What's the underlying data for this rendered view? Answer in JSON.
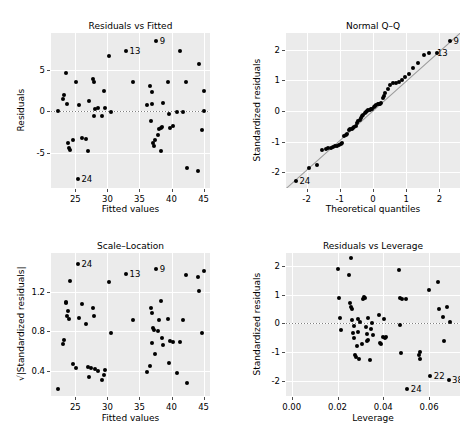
{
  "figure": {
    "background": "#ffffff",
    "panel_background": "#ebebeb",
    "grid_color": "#ffffff",
    "point_color": "#000000",
    "reference_line_color": "#808080"
  },
  "chart_data": [
    {
      "type": "scatter",
      "name": "residuals-vs-fitted",
      "title": "Residuals vs Fitted",
      "xlabel": "Fitted values",
      "ylabel": "Residuals",
      "xlim": [
        21.2,
        46.0
      ],
      "ylim": [
        -9.2,
        9.4
      ],
      "xticks": [
        25,
        30,
        35,
        40,
        45
      ],
      "yticks": [
        -5,
        0,
        5
      ],
      "grid": true,
      "hline": 0,
      "x": [
        22.3,
        23.0,
        23.3,
        23.6,
        23.7,
        23.9,
        24.0,
        24.2,
        24.6,
        25.1,
        25.4,
        25.5,
        26.0,
        26.6,
        27.0,
        27.2,
        27.8,
        27.9,
        27.9,
        28.0,
        28.6,
        29.2,
        29.5,
        29.6,
        30.3,
        30.6,
        32.9,
        34.0,
        36.2,
        36.6,
        36.8,
        36.9,
        37.0,
        37.1,
        37.2,
        37.4,
        37.6,
        37.9,
        38.1,
        38.3,
        38.4,
        38.5,
        38.6,
        39.4,
        39.6,
        39.8,
        40.2,
        40.8,
        41.3,
        41.8,
        42.3,
        42.4,
        44.1,
        44.3,
        44.8,
        45.0,
        45.1
      ],
      "y": [
        0.1,
        1.5,
        2.0,
        4.6,
        0.9,
        -3.8,
        -4.4,
        -4.6,
        -3.4,
        3.5,
        -8.1,
        0.8,
        -3.2,
        -3.3,
        -4.8,
        1.2,
        3.9,
        3.5,
        -0.6,
        0.3,
        0.4,
        -0.6,
        2.4,
        0.4,
        6.7,
        -0.1,
        7.2,
        3.5,
        0.8,
        3.0,
        -1.1,
        0.9,
        2.3,
        -3.8,
        -4.1,
        -3.4,
        8.4,
        -2.8,
        -2.1,
        -4.7,
        -2.0,
        -1.9,
        1.0,
        3.5,
        -0.3,
        -2.0,
        -1.8,
        -0.1,
        7.3,
        -0.1,
        3.5,
        -6.8,
        -7.1,
        5.7,
        -2.2,
        2.5,
        0.1
      ],
      "labeled_points": [
        {
          "label": "9",
          "x": 37.6,
          "y": 8.4
        },
        {
          "label": "13",
          "x": 32.9,
          "y": 7.2
        },
        {
          "label": "24",
          "x": 25.4,
          "y": -8.1
        }
      ]
    },
    {
      "type": "scatter",
      "name": "normal-qq",
      "title": "Normal Q–Q",
      "xlabel": "Theoretical quantiles",
      "ylabel": "Standardized residuals",
      "xlim": [
        -2.62,
        2.62
      ],
      "ylim": [
        -2.52,
        2.55
      ],
      "xticks": [
        -2,
        -1,
        0,
        1,
        2
      ],
      "yticks": [
        -2,
        -1,
        0,
        1,
        2
      ],
      "grid": true,
      "qq_line": {
        "slope": 0.97,
        "intercept": 0.02
      },
      "x": [
        -2.32,
        -1.93,
        -1.7,
        -1.53,
        -1.43,
        -1.35,
        -1.27,
        -1.2,
        -1.14,
        -1.08,
        -1.02,
        -0.97,
        -0.92,
        -0.87,
        -0.82,
        -0.78,
        -0.73,
        -0.69,
        -0.64,
        -0.6,
        -0.56,
        -0.52,
        -0.48,
        -0.44,
        -0.4,
        -0.36,
        -0.32,
        -0.29,
        -0.25,
        -0.21,
        -0.17,
        -0.14,
        -0.1,
        -0.06,
        -0.02,
        0.02,
        0.06,
        0.1,
        0.14,
        0.17,
        0.21,
        0.25,
        0.29,
        0.32,
        0.36,
        0.44,
        0.52,
        0.6,
        0.69,
        0.78,
        0.87,
        0.97,
        1.08,
        1.2,
        1.35,
        1.53,
        1.7,
        1.93,
        2.32
      ],
      "y": [
        -2.28,
        -1.88,
        -1.78,
        -1.27,
        -1.26,
        -1.22,
        -1.2,
        -1.18,
        -1.16,
        -1.14,
        -1.12,
        -1.08,
        -1.05,
        -0.82,
        -0.8,
        -0.76,
        -0.62,
        -0.6,
        -0.58,
        -0.56,
        -0.54,
        -0.5,
        -0.4,
        -0.34,
        -0.28,
        -0.22,
        -0.18,
        -0.12,
        -0.08,
        -0.04,
        0.0,
        0.02,
        0.04,
        0.06,
        0.08,
        0.12,
        0.16,
        0.2,
        0.22,
        0.24,
        0.24,
        0.26,
        0.44,
        0.5,
        0.58,
        0.72,
        0.86,
        0.9,
        0.92,
        0.96,
        1.02,
        1.1,
        1.2,
        1.42,
        1.56,
        1.82,
        1.88,
        1.9,
        2.28
      ],
      "labeled_points": [
        {
          "label": "9",
          "x": 2.32,
          "y": 2.28
        },
        {
          "label": "13",
          "x": 1.82,
          "y": 1.88
        },
        {
          "label": "24",
          "x": -2.32,
          "y": -2.28
        }
      ]
    },
    {
      "type": "scatter",
      "name": "scale-location",
      "title": "Scale–Location",
      "xlabel": "Fitted values",
      "ylabel": "√|Standardized residuals|",
      "xlim": [
        21.2,
        46.0
      ],
      "ylim": [
        0.14,
        1.6
      ],
      "xticks": [
        25,
        30,
        35,
        40,
        45
      ],
      "yticks": [
        0.4,
        0.8,
        1.2
      ],
      "grid": true,
      "x": [
        22.3,
        23.0,
        23.3,
        23.5,
        23.6,
        23.7,
        23.9,
        24.0,
        24.2,
        24.6,
        25.1,
        25.4,
        25.5,
        26.0,
        26.6,
        27.0,
        27.2,
        27.4,
        27.8,
        27.9,
        28.0,
        28.6,
        29.2,
        29.5,
        29.6,
        30.3,
        30.6,
        32.9,
        34.0,
        36.2,
        36.6,
        36.8,
        36.9,
        37.0,
        37.1,
        37.2,
        37.4,
        37.6,
        37.9,
        38.1,
        38.3,
        38.5,
        38.6,
        39.4,
        39.6,
        39.8,
        40.2,
        40.8,
        41.3,
        41.8,
        42.3,
        42.4,
        44.1,
        44.3,
        44.8,
        45.0
      ],
      "y": [
        0.21,
        0.67,
        0.71,
        1.09,
        1.1,
        0.96,
        1.01,
        0.93,
        1.31,
        0.47,
        0.43,
        1.49,
        0.94,
        1.08,
        0.88,
        0.44,
        0.33,
        0.43,
        1.04,
        0.96,
        0.42,
        0.4,
        0.3,
        0.35,
        0.41,
        1.3,
        0.78,
        1.39,
        0.92,
        0.38,
        0.45,
        1.04,
        0.99,
        0.68,
        0.83,
        0.81,
        0.57,
        1.44,
        0.8,
        0.92,
        1.11,
        0.73,
        0.66,
        0.93,
        0.48,
        0.7,
        0.69,
        0.37,
        0.69,
        0.92,
        1.38,
        0.27,
        1.36,
        1.21,
        0.78,
        1.42
      ],
      "labeled_points": [
        {
          "label": "24",
          "x": 25.4,
          "y": 1.49
        },
        {
          "label": "9",
          "x": 37.6,
          "y": 1.44
        },
        {
          "label": "13",
          "x": 32.9,
          "y": 1.39
        }
      ]
    },
    {
      "type": "scatter",
      "name": "residuals-vs-leverage",
      "title": "Residuals vs Leverage",
      "xlabel": "Leverage",
      "ylabel": "Standardized residuals",
      "xlim": [
        -0.0025,
        0.0735
      ],
      "ylim": [
        -2.52,
        2.45
      ],
      "xticks": [
        0.0,
        0.02,
        0.04,
        0.06
      ],
      "xticklabels": [
        "0.00",
        "0.02",
        "0.04",
        "0.06"
      ],
      "yticks": [
        -2,
        -1,
        0,
        1,
        2
      ],
      "grid": true,
      "hline": 0,
      "x": [
        0.02,
        0.0205,
        0.021,
        0.0215,
        0.025,
        0.0255,
        0.0258,
        0.026,
        0.0262,
        0.0265,
        0.0268,
        0.027,
        0.0272,
        0.0275,
        0.028,
        0.0285,
        0.0288,
        0.029,
        0.0295,
        0.03,
        0.0305,
        0.031,
        0.0315,
        0.032,
        0.0325,
        0.0328,
        0.033,
        0.0332,
        0.0335,
        0.034,
        0.0345,
        0.035,
        0.0355,
        0.038,
        0.0385,
        0.039,
        0.04,
        0.0405,
        0.0408,
        0.0412,
        0.047,
        0.0472,
        0.0475,
        0.0478,
        0.048,
        0.05,
        0.0505,
        0.0555,
        0.056,
        0.0562,
        0.06,
        0.0605,
        0.064,
        0.0645,
        0.066,
        0.0665,
        0.068,
        0.0685,
        0.069
      ],
      "y": [
        1.88,
        0.88,
        0.18,
        -0.22,
        1.7,
        0.72,
        0.58,
        2.28,
        0.52,
        0.12,
        -0.32,
        -0.08,
        -0.52,
        -1.1,
        -1.18,
        -0.78,
        -0.3,
        0.16,
        -1.22,
        0.06,
        -0.72,
        0.86,
        0.92,
        0.88,
        -0.12,
        -0.38,
        -0.62,
        0.2,
        -0.58,
        -1.26,
        -0.18,
        0.0,
        -0.4,
        0.28,
        -0.68,
        -0.72,
        -0.46,
        0.16,
        -0.52,
        -0.48,
        1.86,
        0.88,
        -0.05,
        -1.04,
        0.86,
        0.86,
        -2.28,
        -1.1,
        -0.98,
        -1.22,
        1.18,
        -1.82,
        1.44,
        0.5,
        0.22,
        -0.6,
        0.58,
        -1.95,
        0.04
      ],
      "labeled_points": [
        {
          "label": "22",
          "x": 0.0605,
          "y": -1.82
        },
        {
          "label": "38",
          "x": 0.0685,
          "y": -1.95
        },
        {
          "label": "24",
          "x": 0.0505,
          "y": -2.28
        }
      ]
    }
  ]
}
